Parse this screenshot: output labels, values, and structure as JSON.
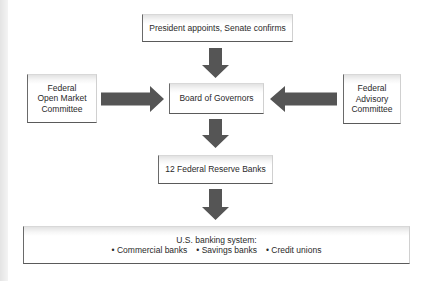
{
  "diagram": {
    "nodes": {
      "president": {
        "label": "President appoints, Senate confirms"
      },
      "fomc": {
        "label": "Federal\nOpen Market\nCommittee"
      },
      "board": {
        "label": "Board of Governors"
      },
      "advisory": {
        "label": "Federal\nAdvisory\nCommittee"
      },
      "reserve_banks": {
        "label": "12 Federal Reserve Banks"
      },
      "banking_system": {
        "label": "U.S. banking system:",
        "items": [
          "Commercial banks",
          "Savings banks",
          "Credit unions"
        ]
      }
    },
    "edges": [
      {
        "from": "president",
        "to": "board",
        "direction": "down"
      },
      {
        "from": "fomc",
        "to": "board",
        "direction": "right"
      },
      {
        "from": "advisory",
        "to": "board",
        "direction": "left"
      },
      {
        "from": "board",
        "to": "reserve_banks",
        "direction": "down"
      },
      {
        "from": "reserve_banks",
        "to": "banking_system",
        "direction": "down"
      }
    ],
    "colors": {
      "arrow": "#555555",
      "box_border": "#5a5a5a",
      "text": "#2a2a2a"
    }
  }
}
